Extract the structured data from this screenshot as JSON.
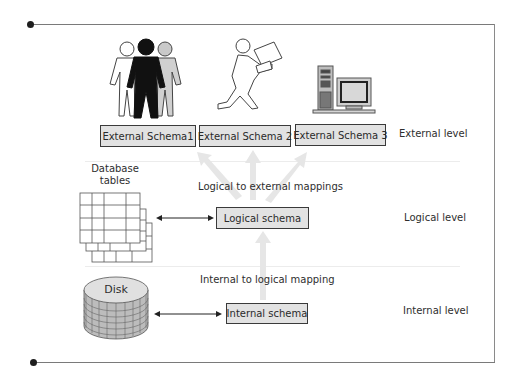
{
  "diagram": {
    "type": "three-level database architecture",
    "levels": [
      {
        "id": "external",
        "label": "External level"
      },
      {
        "id": "logical",
        "label": "Logical level"
      },
      {
        "id": "internal",
        "label": "Internal level"
      }
    ],
    "external_schemas": [
      {
        "label": "External Schema1",
        "icon": "user-group-icon"
      },
      {
        "label": "External Schema 2",
        "icon": "running-person-with-package-icon"
      },
      {
        "label": "External Schema 3",
        "icon": "desktop-computer-icon"
      }
    ],
    "logical_schema": {
      "label": "Logical schema"
    },
    "internal_schema": {
      "label": "Internal schema"
    },
    "mappings": {
      "logical_to_external": "Logical to external mappings",
      "internal_to_logical": "Internal to logical mapping"
    },
    "storage": {
      "tables_label_line1": "Database",
      "tables_label_line2": "tables",
      "disk_label": "Disk"
    },
    "colors": {
      "box_fill": "#e2e2e2",
      "box_border": "#3a3a3a",
      "mapping_arrow": "#e6e6e6",
      "frame_line": "#7a7a7a"
    }
  }
}
